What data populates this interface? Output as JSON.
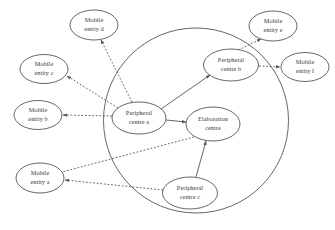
{
  "diagram": {
    "coverage_area": {
      "name": "coverage-boundary",
      "cx": 196,
      "cy": 120.5,
      "r": 92.5
    },
    "colors": {
      "stroke": "#55555a",
      "label": "#3b3b40",
      "background": "#ffffff"
    },
    "nodes": [
      {
        "id": "peripheral-centre-a",
        "line1": "Peripheral",
        "line2": "centre a",
        "cx": 139,
        "cy": 118,
        "rx": 27,
        "ry": 16,
        "location": "inside"
      },
      {
        "id": "peripheral-centre-b",
        "line1": "Peripheral",
        "line2": "centre b",
        "cx": 231,
        "cy": 65,
        "rx": 27.5,
        "ry": 16,
        "location": "inside"
      },
      {
        "id": "elaboration-centre",
        "line1": "Elaboration",
        "line2": "centre",
        "cx": 213,
        "cy": 124,
        "rx": 27,
        "ry": 17,
        "location": "inside"
      },
      {
        "id": "peripheral-centre-c",
        "line1": "Peripheral",
        "line2": "centre c",
        "cx": 190,
        "cy": 193,
        "rx": 27.5,
        "ry": 16,
        "location": "inside"
      },
      {
        "id": "mobile-entity-a",
        "line1": "Mobile",
        "line2": "entity a",
        "cx": 40,
        "cy": 178,
        "rx": 24,
        "ry": 15,
        "location": "outside"
      },
      {
        "id": "mobile-entity-b",
        "line1": "Mobile",
        "line2": "entity b",
        "cx": 38,
        "cy": 115,
        "rx": 24,
        "ry": 14.5,
        "location": "outside"
      },
      {
        "id": "mobile-entity-c",
        "line1": "Mobile",
        "line2": "entity c",
        "cx": 44,
        "cy": 69,
        "rx": 24,
        "ry": 14.5,
        "location": "outside"
      },
      {
        "id": "mobile-entity-d",
        "line1": "Mobile",
        "line2": "entity d",
        "cx": 94,
        "cy": 25,
        "rx": 24,
        "ry": 15,
        "location": "outside"
      },
      {
        "id": "mobile-entity-e",
        "line1": "Mobile",
        "line2": "entity e",
        "cx": 273,
        "cy": 26,
        "rx": 24,
        "ry": 15,
        "location": "outside"
      },
      {
        "id": "mobile-entity-f",
        "line1": "Mobile",
        "line2": "entity f",
        "cx": 305,
        "cy": 67,
        "rx": 24,
        "ry": 14.5,
        "location": "outside"
      }
    ],
    "edges": [
      {
        "id": "edge-centre-a-centre-b",
        "from": "peripheral-centre-a",
        "to": "peripheral-centre-b",
        "style": "solid",
        "arrows": "both",
        "path": "M 161 109 L 210 75"
      },
      {
        "id": "edge-centre-a-elaboration",
        "from": "peripheral-centre-a",
        "to": "elaboration-centre",
        "style": "solid",
        "arrows": "both",
        "path": "M 166 120 L 186 122"
      },
      {
        "id": "edge-centre-c-elaboration",
        "from": "peripheral-centre-c",
        "to": "elaboration-centre",
        "style": "solid",
        "arrows": "end",
        "path": "M 196 177 L 206 141"
      },
      {
        "id": "edge-centre-a-entity-d",
        "from": "peripheral-centre-a",
        "to": "mobile-entity-d",
        "style": "dashed",
        "arrows": "both",
        "path": "M 132 102 L 101 40"
      },
      {
        "id": "edge-centre-a-entity-c",
        "from": "peripheral-centre-a",
        "to": "mobile-entity-c",
        "style": "dashed",
        "arrows": "both",
        "path": "M 118 108 L 67 76"
      },
      {
        "id": "edge-centre-a-entity-b",
        "from": "peripheral-centre-a",
        "to": "mobile-entity-b",
        "style": "dashed",
        "arrows": "start",
        "path": "M 112 116 L 63 115"
      },
      {
        "id": "edge-centre-b-entity-e",
        "from": "peripheral-centre-b",
        "to": "mobile-entity-e",
        "style": "dashed",
        "arrows": "both",
        "path": "M 238 50 L 261 39"
      },
      {
        "id": "edge-centre-b-entity-f",
        "from": "peripheral-centre-b",
        "to": "mobile-entity-f",
        "style": "dashed",
        "arrows": "both",
        "path": "M 259 66 L 280 67"
      },
      {
        "id": "edge-elaboration-entity-a",
        "from": "elaboration-centre",
        "to": "mobile-entity-a",
        "style": "dashed",
        "arrows": "none",
        "path": "M 194 137 L 62 172"
      },
      {
        "id": "edge-centre-c-entity-a",
        "from": "peripheral-centre-c",
        "to": "mobile-entity-a",
        "style": "dashed",
        "arrows": "end",
        "path": "M 163 190 L 65 180"
      }
    ]
  }
}
